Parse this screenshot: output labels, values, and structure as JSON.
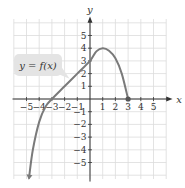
{
  "chart_data": {
    "type": "line",
    "title": "",
    "xlabel": "x",
    "ylabel": "y",
    "xlim": [
      -6,
      6
    ],
    "ylim": [
      -6,
      6
    ],
    "grid": true,
    "x_ticks": [
      "−5",
      "−4",
      "−3",
      "−2",
      "−1",
      "1",
      "2",
      "3",
      "4",
      "5"
    ],
    "y_ticks": [
      "5",
      "4",
      "3",
      "2",
      "1",
      "−1",
      "−2",
      "−3",
      "−4",
      "−5"
    ],
    "series": [
      {
        "name": "y = f(x)",
        "color": "#7a7a7a",
        "points": [
          [
            -4.8,
            -6.2
          ],
          [
            -4.5,
            -4.0
          ],
          [
            -4.0,
            -1.8
          ],
          [
            -3.5,
            -0.6
          ],
          [
            -3.0,
            0.0
          ],
          [
            -2.0,
            1.0
          ],
          [
            -1.0,
            2.0
          ],
          [
            0.0,
            3.0
          ],
          [
            0.5,
            3.75
          ],
          [
            1.0,
            4.0
          ],
          [
            1.5,
            3.8
          ],
          [
            2.0,
            3.2
          ],
          [
            2.5,
            2.0
          ],
          [
            3.0,
            0.0
          ]
        ],
        "start_marker": "arrow",
        "end_marker": "filled-dot"
      }
    ],
    "annotation": "y = f(x)"
  },
  "label": {
    "text": "y = f(x)"
  },
  "axes": {
    "x_label": "x",
    "y_label": "y"
  }
}
